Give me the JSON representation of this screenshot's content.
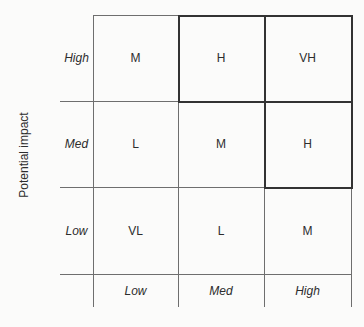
{
  "matrix": {
    "y_axis_title": "Potential impact",
    "row_labels": [
      "High",
      "Med",
      "Low"
    ],
    "col_labels": [
      "Low",
      "Med",
      "High"
    ],
    "cells": [
      [
        "M",
        "H",
        "VH"
      ],
      [
        "L",
        "M",
        "H"
      ],
      [
        "VL",
        "L",
        "M"
      ]
    ],
    "highlighted_cells": [
      [
        0,
        1
      ],
      [
        0,
        2
      ],
      [
        1,
        2
      ]
    ],
    "colors": {
      "grid_line": "#6e6e6e",
      "highlight_border": "#333333",
      "text": "#2d2d2d",
      "background": "#fbfbfa"
    }
  }
}
